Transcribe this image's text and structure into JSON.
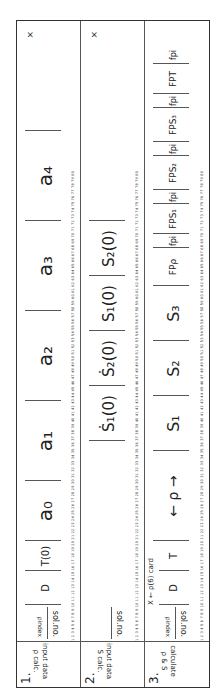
{
  "card": {
    "rows": [
      {
        "number": "1.",
        "label_line1": "input data",
        "label_line2": "ρ calc.",
        "id_fields": {
          "sol_no": "sol.no.",
          "index": "ρindex"
        },
        "fields": [
          {
            "name": "D",
            "text": "D"
          },
          {
            "name": "T0",
            "text": "T(0)"
          },
          {
            "name": "a0",
            "text": "a₀"
          },
          {
            "name": "a1",
            "text": "a₁"
          },
          {
            "name": "a2",
            "text": "a₂"
          },
          {
            "name": "a3",
            "text": "a₃"
          },
          {
            "name": "a4",
            "text": "a₄"
          }
        ],
        "end_mark": "×"
      },
      {
        "number": "2.",
        "label_line1": "input data",
        "label_line2": "S calc.",
        "id_fields": {
          "sol_no": "sol.no."
        },
        "fields": [
          {
            "name": "S1dot0",
            "text": "Ṡ₁(0)"
          },
          {
            "name": "S2dot0",
            "text": "Ṡ₂(0)"
          },
          {
            "name": "S1_0",
            "text": "S₁(0)"
          },
          {
            "name": "S2_0",
            "text": "S₂(0)"
          }
        ],
        "end_mark": "×"
      },
      {
        "number": "3.",
        "label_line1": "calculate",
        "label_line2": "ρ & S",
        "id_fields": {
          "sol_no": "sol.no.",
          "index": "ρindex",
          "card_note": "X ← ρ(6) card"
        },
        "fields": [
          {
            "name": "D",
            "text": "D"
          },
          {
            "name": "T",
            "text": "T"
          },
          {
            "name": "rho",
            "text": "← ρ →"
          },
          {
            "name": "S1",
            "text": "S₁"
          },
          {
            "name": "S2",
            "text": "S₂"
          },
          {
            "name": "S3",
            "text": "S₃"
          },
          {
            "name": "FPrho",
            "text": "FPρ"
          },
          {
            "name": "fpi1",
            "text": "fpi"
          },
          {
            "name": "FPS1",
            "text": "FPS₁"
          },
          {
            "name": "fpi2",
            "text": "fpi"
          },
          {
            "name": "FPS2",
            "text": "FPS₂"
          },
          {
            "name": "fpi3",
            "text": "fpi"
          },
          {
            "name": "FPS3",
            "text": "FPS₃"
          },
          {
            "name": "fpi4",
            "text": "fpi"
          },
          {
            "name": "FPT",
            "text": "FPT"
          },
          {
            "name": "fpi5",
            "text": "fpi"
          }
        ]
      }
    ],
    "column_scale": "1 2 3 4 5 6 7 8 9 10 11 12 13 14 15 16 17 18 19 20 21 22 23 24 25 26 27 28 29 30 31 32 33 34 35 36 37 38 39 40 41 42 43 44 45 46 47 48 49 50 51 52 53 54 55 56 57 58 59 60 61 62 63 64 65 66 67 68 69 70 71 72 73 74 75 76 77 78 79 80"
  }
}
